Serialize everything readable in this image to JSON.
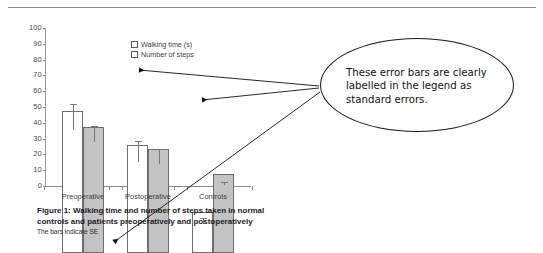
{
  "chart_data": {
    "type": "bar",
    "title": "",
    "categories": [
      "Preoperative",
      "Postoperative",
      "Controls"
    ],
    "series": [
      {
        "name": "Walking time (s)",
        "values": [
          90,
          68.5,
          26
        ],
        "errors": [
          10.5,
          8.5,
          2.5
        ]
      },
      {
        "name": "Number of steps",
        "values": [
          80,
          66,
          50
        ],
        "errors": [
          6.5,
          6,
          1.5
        ]
      }
    ],
    "xlabel": "",
    "ylabel": "",
    "ylim": [
      0,
      100
    ],
    "yticks": [
      0,
      10,
      20,
      30,
      40,
      50,
      60,
      70,
      80,
      90,
      100
    ],
    "grid": false,
    "legend_position": "inside-top-center",
    "error_bar_type": "SE",
    "colors": {
      "series1_fill": "#ffffff",
      "series2_fill": "#c3c3c3",
      "bar_stroke": "#6e6e6e",
      "axis": "#8a8a8a"
    },
    "annotations": [
      "Figure 1: Walking time and number of steps taken in normal controls and patients preoperatively and postoperatively",
      "The bars indicate SE"
    ]
  },
  "figure": {
    "caption_main": "Figure 1: Walking time and number of steps taken in normal controls and patients preoperatively and postoperatively",
    "caption_sub": "The bars indicate SE"
  },
  "legend": {
    "items": [
      {
        "label": "Walking time (s)"
      },
      {
        "label": "Number of steps"
      }
    ]
  },
  "callout": {
    "text": "These error bars are clearly labelled in the legend as standard errors.",
    "pointer_targets": [
      "postoperative-walking-time-error-bar",
      "controls-number-of-steps-error-bar",
      "caption-se-note"
    ]
  }
}
